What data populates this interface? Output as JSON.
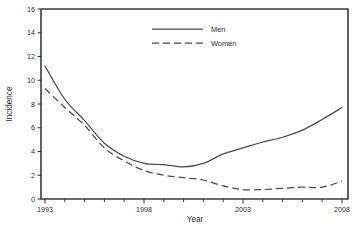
{
  "chart_data": {
    "type": "line",
    "title": "",
    "subtitle": "",
    "xlabel": "Year",
    "ylabel": "Incidence",
    "xlim": [
      1993,
      2008
    ],
    "ylim": [
      0,
      16
    ],
    "grid": false,
    "legend_position": "top-center",
    "y_ticks": [
      0,
      2,
      4,
      6,
      8,
      10,
      12,
      14,
      16
    ],
    "y_tick_labels": [
      "0",
      "2",
      "4",
      "6",
      "8",
      "10",
      "12",
      "14",
      "16"
    ],
    "x_ticks": [
      1993,
      1994,
      1995,
      1996,
      1997,
      1998,
      1999,
      2000,
      2001,
      2002,
      2003,
      2004,
      2005,
      2006,
      2007,
      2008
    ],
    "x_tick_labels_shown": [
      "1993",
      "1998",
      "2003",
      "2008"
    ],
    "x_labeled_ticks": [
      1993,
      1998,
      2003,
      2008
    ],
    "x": [
      1993,
      1994,
      1995,
      1996,
      1997,
      1998,
      1999,
      2000,
      2001,
      2002,
      2003,
      2004,
      2005,
      2006,
      2007,
      2008
    ],
    "series": [
      {
        "name": "Men",
        "style": "solid",
        "color": "#4a4a4a",
        "values": [
          11.2,
          8.4,
          6.6,
          4.7,
          3.6,
          3.0,
          2.9,
          2.7,
          3.0,
          3.8,
          4.3,
          4.8,
          5.2,
          5.8,
          6.7,
          7.7
        ]
      },
      {
        "name": "Women",
        "style": "dashed",
        "color": "#4a4a4a",
        "values": [
          9.3,
          7.7,
          6.2,
          4.3,
          3.2,
          2.4,
          2.0,
          1.8,
          1.6,
          1.1,
          0.8,
          0.8,
          0.9,
          1.0,
          1.0,
          1.5
        ]
      }
    ]
  },
  "legend": {
    "entries": [
      {
        "label": "Men"
      },
      {
        "label": "Women"
      }
    ]
  },
  "axes": {
    "x_title": "Year",
    "y_title": "Incidence"
  }
}
